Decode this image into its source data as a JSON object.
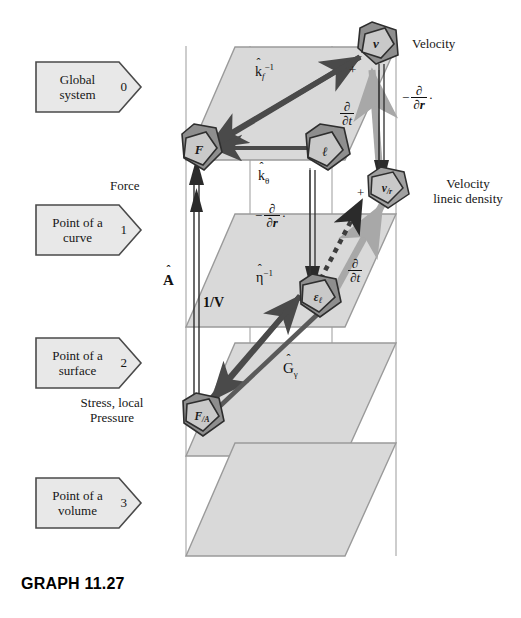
{
  "caption": "GRAPH 11.27",
  "levels": [
    {
      "name": "global-system",
      "line1": "Global",
      "line2": "system",
      "num": "0"
    },
    {
      "name": "point-of-a-curve",
      "line1": "Point of a",
      "line2": "curve",
      "num": "1"
    },
    {
      "name": "point-of-a-surface",
      "line1": "Point of a",
      "line2": "surface",
      "num": "2"
    },
    {
      "name": "point-of-a-volume",
      "line1": "Point of a",
      "line2": "volume",
      "num": "3"
    }
  ],
  "annotations": {
    "force": "Force",
    "velocity": "Velocity",
    "velocity_lineic_density_l1": "Velocity",
    "velocity_lineic_density_l2": "lineic density",
    "stress_l1": "Stress, local",
    "stress_l2": "Pressure"
  },
  "nodes": [
    {
      "id": "v",
      "label": "v",
      "sub": "",
      "name": "node-velocity"
    },
    {
      "id": "F",
      "label": "F",
      "sub": "",
      "name": "node-force"
    },
    {
      "id": "l",
      "label": "ℓ",
      "sub": "",
      "name": "node-length"
    },
    {
      "id": "v_r",
      "label": "v",
      "sub": "/r",
      "name": "node-velocity-lineic-density"
    },
    {
      "id": "eps_l",
      "label": "ε",
      "sub": "ℓ",
      "name": "node-epsilon-lineic"
    },
    {
      "id": "F_A",
      "label": "F",
      "sub": "/A",
      "name": "node-force-per-area"
    }
  ],
  "operators": {
    "k_f_inv": {
      "base": "k",
      "hat": "ˆ",
      "sub": "f",
      "sup": "−1"
    },
    "k_theta": {
      "base": "k",
      "hat": "ˆ",
      "sub": "θ",
      "sup": ""
    },
    "eta_inv": {
      "base": "η",
      "hat": "ˆ",
      "sub": "",
      "sup": "−1"
    },
    "G_gamma": {
      "base": "G",
      "hat": "ˆ",
      "sub": "γ",
      "sup": ""
    },
    "A_hat": {
      "base": "A",
      "hat": "ˆ",
      "sub": "",
      "sup": ""
    },
    "inv_V": {
      "text": "1/V"
    },
    "d_dt_top": {
      "num": "∂",
      "den": "∂t",
      "prefix": "",
      "suffix": ""
    },
    "d_dt_bottom": {
      "num": "∂",
      "den": "∂t",
      "prefix": "",
      "suffix": ""
    },
    "d_dr_right": {
      "num": "∂",
      "den": "∂r",
      "prefix": "−",
      "suffix": "·"
    },
    "d_dr_mid": {
      "num": "∂",
      "den": "∂r",
      "prefix": "−",
      "suffix": "·"
    }
  },
  "signs": {
    "plus_v": "+",
    "plus_v_r": "+"
  },
  "colors": {
    "plane_fill": "#d9d9d9",
    "plane_stroke": "#9a9a9a",
    "grid_line": "#8d8d8d",
    "arrow_dark": "#4a4a4a",
    "arrow_light": "#a8a8a8",
    "arrow_black": "#2b2b2b",
    "node_face": "#c9c9c9",
    "node_top": "#8e8e8e",
    "node_side": "#6f6f6f",
    "node_stroke": "#2e2e2e",
    "flag_fill": "#e8e8e8",
    "flag_stroke": "#4a4a4a",
    "text": "#161616"
  }
}
